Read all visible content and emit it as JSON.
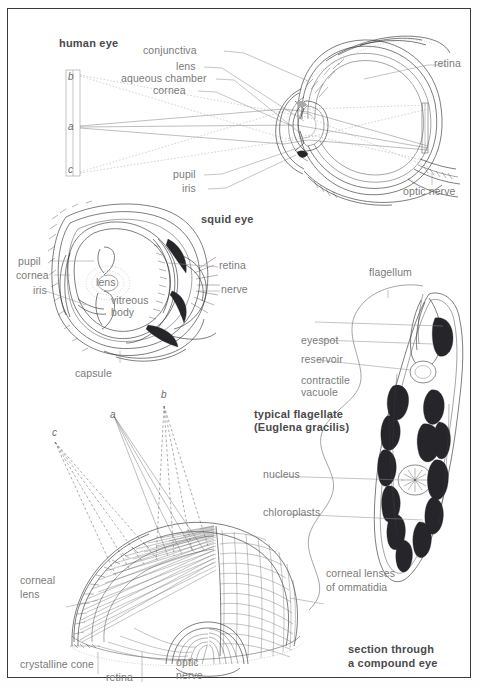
{
  "page": {
    "background_color": "#ffffff",
    "frame_color": "#3a3a3c",
    "label_color": "#7a7a7a",
    "title_color": "#4a4a4c"
  },
  "figures": {
    "human_eye": {
      "title": "human eye",
      "labels": {
        "conjunctiva": "conjunctiva",
        "lens": "lens",
        "aqueous_chamber": "aqueous chamber",
        "cornea": "cornea",
        "pupil": "pupil",
        "iris": "iris",
        "retina": "retina",
        "optic_nerve": "optic nerve"
      },
      "object_markers": {
        "top": "b",
        "middle": "a",
        "bottom": "c"
      }
    },
    "squid_eye": {
      "title": "squid eye",
      "labels": {
        "pupil": "pupil",
        "cornea": "cornea",
        "iris": "iris",
        "lens": "lens",
        "vitreous_body_line1": "vitreous",
        "vitreous_body_line2": "body",
        "capsule": "capsule",
        "retina": "retina",
        "nerve": "nerve"
      }
    },
    "flagellate": {
      "title_line1": "typical flagellate",
      "title_line2": "(Euglena gracilis)",
      "labels": {
        "flagellum": "flagellum",
        "eyespot": "eyespot",
        "reservoir": "reservoir",
        "contractile_line1": "contractile",
        "contractile_line2": "vacuole",
        "nucleus": "nucleus",
        "chloroplasts": "chloroplasts"
      }
    },
    "compound_eye": {
      "title_line1": "section through",
      "title_line2": "a compound eye",
      "labels": {
        "corneal_lens_line1": "corneal",
        "corneal_lens_line2": "lens",
        "crystalline_cone": "crystalline cone",
        "retina": "retina",
        "optic_nerve_line1": "optic",
        "optic_nerve_line2": "nerve",
        "corneal_lenses_line1": "corneal lenses",
        "corneal_lenses_line2": "of ommatidia"
      },
      "ray_markers": {
        "left": "c",
        "middle": "a",
        "right": "b"
      }
    }
  }
}
